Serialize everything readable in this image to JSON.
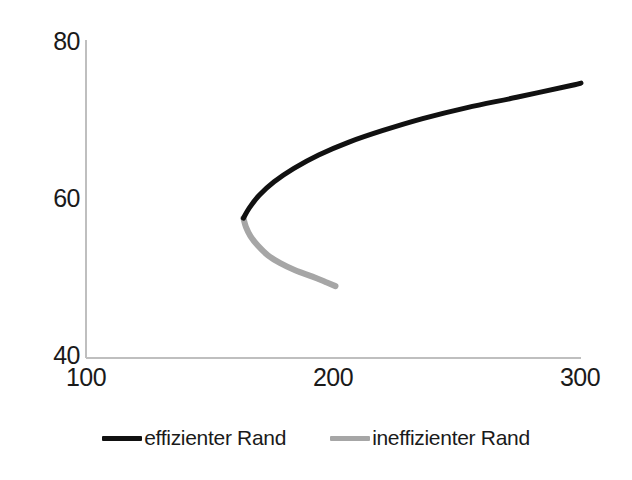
{
  "chart_data": {
    "type": "line",
    "title": "",
    "xlabel": "",
    "ylabel": "",
    "xlim": [
      100,
      300
    ],
    "ylim": [
      40,
      80
    ],
    "xticks": [
      "100",
      "200",
      "300"
    ],
    "yticks": [
      "80",
      "60",
      "40"
    ],
    "grid": false,
    "legend_position": "bottom-center",
    "axis_color": "#bfbfbf",
    "series": [
      {
        "name": "effizienter Rand",
        "color": "#111111",
        "x": [
          163.6,
          166,
          170,
          176,
          184,
          194,
          206,
          220,
          236,
          254,
          274,
          296,
          300
        ],
        "y": [
          57.7,
          59.0,
          60.6,
          62.3,
          64.0,
          65.7,
          67.3,
          68.8,
          70.3,
          71.7,
          73.0,
          74.5,
          74.8
        ]
      },
      {
        "name": "ineffizienter Rand",
        "color": "#a6a6a6",
        "x": [
          163.6,
          164.6,
          166.5,
          169.5,
          173.5,
          178.5,
          184.5,
          191.5,
          197,
          200.8
        ],
        "y": [
          57.7,
          56.6,
          55.4,
          54.2,
          53.0,
          52.0,
          51.1,
          50.3,
          49.6,
          49.1
        ]
      }
    ]
  },
  "legend": {
    "items": [
      {
        "label": "effizienter Rand",
        "color": "#111111"
      },
      {
        "label": "ineffizienter Rand",
        "color": "#a6a6a6"
      }
    ]
  },
  "axes": {
    "y": {
      "labels": [
        "80",
        "60",
        "40"
      ]
    },
    "x": {
      "labels": [
        "100",
        "200",
        "300"
      ]
    }
  }
}
